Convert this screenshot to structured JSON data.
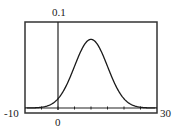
{
  "chart_data": {
    "type": "line",
    "title": "",
    "xlabel": "",
    "ylabel": "",
    "xlim": [
      -10,
      30
    ],
    "ylim": [
      0,
      0.1
    ],
    "grid": false,
    "legend": null,
    "x_tick_spacing": 5,
    "window_labels": {
      "xmin": "-10",
      "xmax": "30",
      "ymax": "0.1",
      "x_origin": "0"
    },
    "series": [
      {
        "name": "normal density curve",
        "description": "Bell-shaped normal curve, approx mean 10, sd 5",
        "mean": 10,
        "sd": 5,
        "x": [
          -10,
          -5,
          0,
          2.5,
          5,
          7.5,
          10,
          12.5,
          15,
          17.5,
          20,
          25,
          30
        ],
        "y": [
          0.0003,
          0.0009,
          0.0108,
          0.026,
          0.0484,
          0.0704,
          0.0798,
          0.0704,
          0.0484,
          0.026,
          0.0108,
          0.0009,
          0.0003
        ]
      }
    ]
  },
  "colors": {
    "line": "#1a1a1a",
    "frame": "#333333",
    "background": "#ffffff"
  }
}
